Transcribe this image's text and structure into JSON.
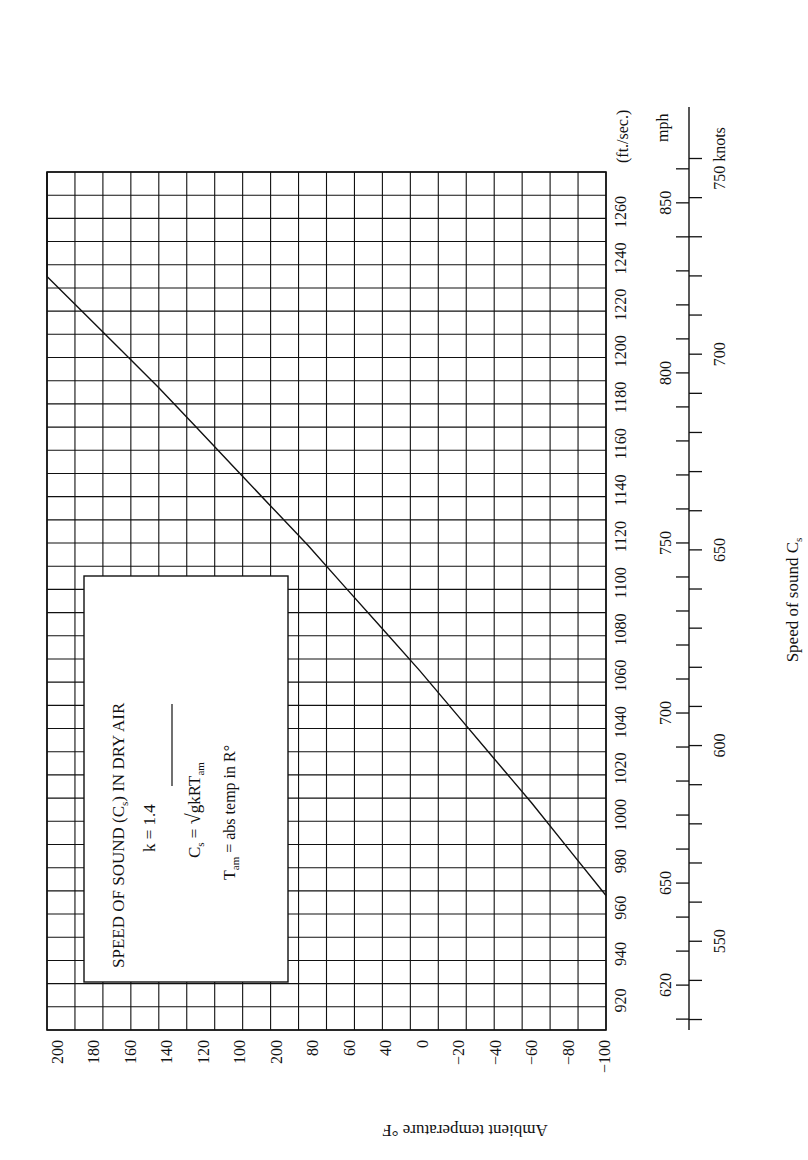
{
  "chart_data": {
    "type": "line",
    "title": "SPEED OF SOUND (Cs) IN DRY AIR",
    "orientation": "rotated 90° clockwise (page printed sideways)",
    "xlabel": "Ambient temperature °F",
    "ylabel": "Speed of sound Cs",
    "temperature_tick_labels": [
      "200",
      "180",
      "160",
      "140",
      "120",
      "100",
      "200",
      "80",
      "60",
      "40",
      "0",
      "−20",
      "−40",
      "−60",
      "−80",
      "−100"
    ],
    "fps_tick_labels": [
      "920",
      "940",
      "960",
      "980",
      "1000",
      "1020",
      "1040",
      "1060",
      "1080",
      "1100",
      "1120",
      "1140",
      "1160",
      "1180",
      "1200",
      "1220",
      "1240",
      "1260"
    ],
    "fps_unit": "(ft./sec.)",
    "mph_tick_labels": [
      "620",
      "650",
      "700",
      "750",
      "800",
      "850"
    ],
    "mph_unit": "mph",
    "knots_tick_labels": [
      "550",
      "600",
      "650",
      "700",
      "750"
    ],
    "knots_unit": "knots",
    "temperature_range_F": [
      -100,
      200
    ],
    "speed_range_fps": [
      890,
      1260
    ],
    "grid": true,
    "series": [
      {
        "name": "Speed of sound in dry air",
        "x_temperature_F": [
          -100,
          -80,
          -60,
          -40,
          -20,
          0,
          20,
          40,
          60,
          80,
          100,
          120,
          140,
          160,
          180,
          200
        ],
        "y_speed_fps": [
          948,
          968,
          988,
          1007,
          1026,
          1045,
          1063,
          1081,
          1099,
          1116,
          1133,
          1150,
          1167,
          1183,
          1199,
          1215
        ]
      }
    ],
    "annotations": {
      "k": "k = 1.4",
      "formula": "Cs = √(gkRTam)",
      "tam_def": "Tam = abs temp in R°"
    }
  },
  "labels": {
    "title_main": "SPEED OF SOUND (C",
    "title_sub": "s",
    "title_tail": ") IN DRY AIR",
    "k_line": "k = 1.4",
    "formula_lhs": "C",
    "formula_lhs_sub": "s",
    "formula_eq": " = ",
    "formula_rad": "gkRT",
    "formula_rad_sub": "am",
    "tam_T": "T",
    "tam_sub": "am",
    "tam_rest": " = abs temp in R°",
    "xaxis": "Ambient temperature °F",
    "yaxis_main": "Speed of sound C",
    "yaxis_sub": "s",
    "fps_unit": "(ft./sec.)",
    "mph_unit": "mph",
    "knots_unit": "knots"
  }
}
